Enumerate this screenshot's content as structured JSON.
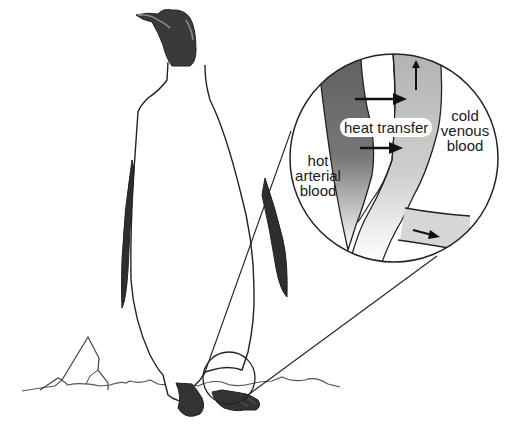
{
  "diagram": {
    "labels": {
      "heat_transfer": "heat transfer",
      "hot_arterial": [
        "hot",
        "arterial",
        "blood"
      ],
      "cold_venous": [
        "cold",
        "venous",
        "blood"
      ]
    },
    "elements": [
      "penguin-body",
      "penguin-head",
      "flipper-left",
      "flipper-right",
      "foot-left",
      "foot-right",
      "ice-ground",
      "iceberg",
      "leg-callout-circle",
      "magnified-inset-circle",
      "artery-vessel",
      "vein-vessel",
      "heat-arrow-upper",
      "heat-arrow-lower",
      "venous-flow-arrow-up",
      "venous-flow-arrow-right"
    ],
    "colors": {
      "ink": "#1a1a1a",
      "dark_fill": "#3a3a3a",
      "artery_grey": "#6e6e6e",
      "vein_grey": "#b8b8b8",
      "background": "#ffffff"
    }
  }
}
